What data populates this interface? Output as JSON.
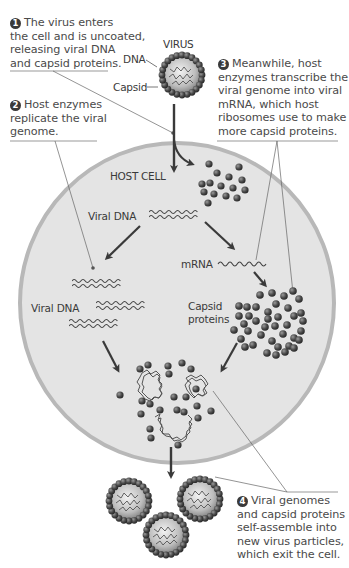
{
  "diagram": {
    "labels": {
      "virus": "VIRUS",
      "dna": "DNA",
      "capsid": "Capsid",
      "host_cell": "HOST CELL",
      "viral_dna_1": "Viral DNA",
      "viral_dna_2": "Viral DNA",
      "mrna": "mRNA",
      "capsid_proteins_line1": "Capsid",
      "capsid_proteins_line2": "proteins"
    },
    "steps": [
      {
        "number": "1",
        "lines": [
          "The virus enters",
          "the cell and is uncoated,",
          "releasing viral DNA",
          "and capsid proteins."
        ]
      },
      {
        "number": "2",
        "lines": [
          "Host enzymes",
          "replicate the viral",
          "genome."
        ]
      },
      {
        "number": "3",
        "lines": [
          "Meanwhile, host",
          "enzymes transcribe the",
          "viral genome into viral",
          "mRNA, which host",
          "ribosomes use to make",
          "more capsid proteins."
        ]
      },
      {
        "number": "4",
        "lines": [
          "Viral genomes",
          "and capsid proteins",
          "self-assemble into",
          "new virus particles,",
          "which exit the cell."
        ]
      }
    ],
    "colors": {
      "cell_fill": "#e4e4e4",
      "cell_membrane": "#b8b8b8",
      "protein": "#4a4a4a",
      "arrow": "#3a3a3a",
      "text": "#4a4a4a"
    }
  }
}
